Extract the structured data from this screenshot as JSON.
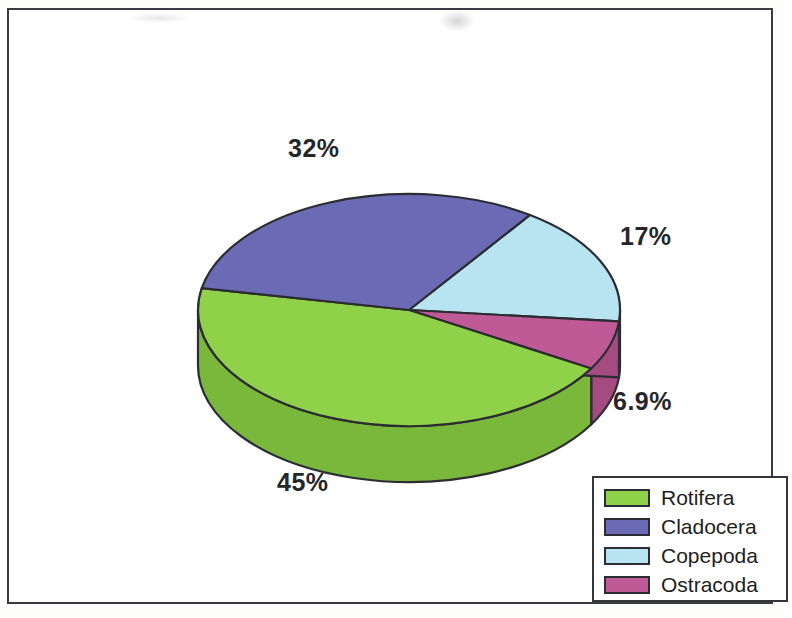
{
  "chart_data": {
    "type": "pie",
    "title": "",
    "subtitle": "",
    "xlabel": "",
    "ylabel": "",
    "legend_position": "bottom-right",
    "three_d": true,
    "categories": [
      "Rotifera",
      "Cladocera",
      "Copepoda",
      "Ostracoda"
    ],
    "values": [
      45,
      32,
      17,
      6.9
    ],
    "labels": [
      "45%",
      "32%",
      "17%",
      "6.9%"
    ],
    "colors": [
      "#8fd24a",
      "#6b6bb5",
      "#b8e4f2",
      "#c05a96"
    ],
    "slices": [
      {
        "name": "Rotifera",
        "value": 45,
        "label": "45%",
        "color": "#8fd24a",
        "side_color": "#79b83b"
      },
      {
        "name": "Cladocera",
        "value": 32,
        "label": "32%",
        "color": "#6b6bb5",
        "side_color": "#5a5a9c"
      },
      {
        "name": "Copepoda",
        "value": 17,
        "label": "17%",
        "color": "#b8e4f2",
        "side_color": "#9acada"
      },
      {
        "name": "Ostracoda",
        "value": 6.9,
        "label": "6.9%",
        "color": "#c05a96",
        "side_color": "#a44b80"
      }
    ]
  },
  "legend": {
    "items": [
      {
        "label": "Rotifera",
        "color": "#8fd24a"
      },
      {
        "label": "Cladocera",
        "color": "#6b6bb5"
      },
      {
        "label": "Copepoda",
        "color": "#b8e4f2"
      },
      {
        "label": "Ostracoda",
        "color": "#c05a96"
      }
    ]
  },
  "style": {
    "outline": "#2c2c33",
    "frame": "#3a3a42",
    "background": "#ffffff"
  }
}
